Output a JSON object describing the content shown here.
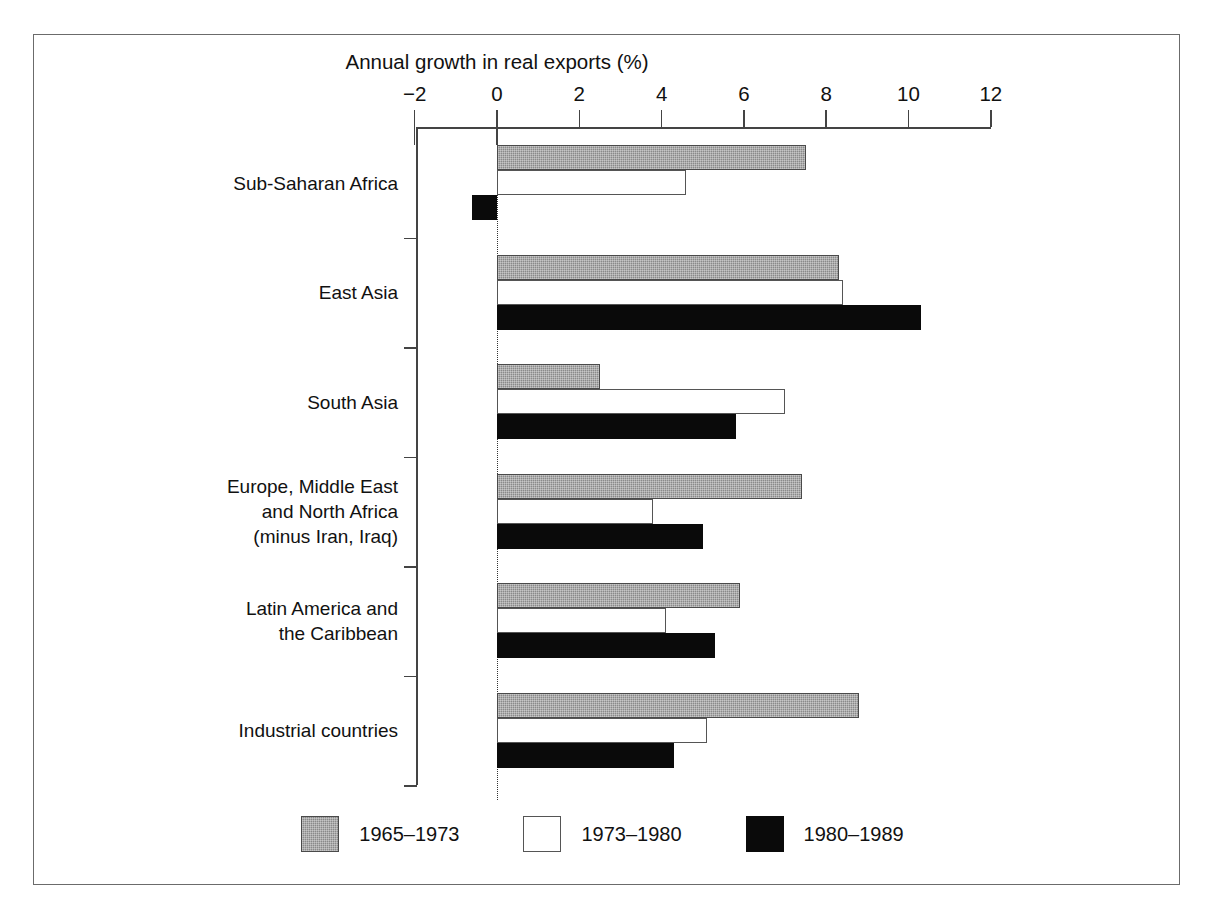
{
  "chart_data": {
    "type": "bar",
    "orientation": "horizontal",
    "title": "Annual growth in real exports (%)",
    "xlabel": "",
    "ylabel": "",
    "xlim": [
      -2,
      12
    ],
    "xticks": [
      -2,
      0,
      2,
      4,
      6,
      8,
      10,
      12
    ],
    "xtick_labels": [
      "−2",
      "0",
      "2",
      "4",
      "6",
      "8",
      "10",
      "12"
    ],
    "grid": false,
    "legend_position": "bottom",
    "zero_reference_line": true,
    "categories": [
      "Sub-Saharan Africa",
      "East Asia",
      "South Asia",
      "Europe, Middle East\nand North Africa\n(minus Iran, Iraq)",
      "Latin America and\nthe Caribbean",
      "Industrial countries"
    ],
    "series": [
      {
        "name": "1965–1973",
        "color": "#8a8a8a",
        "values": [
          7.5,
          8.3,
          2.5,
          7.4,
          5.9,
          8.8
        ]
      },
      {
        "name": "1973–1980",
        "color": "#ffffff",
        "values": [
          4.6,
          8.4,
          7.0,
          3.8,
          4.1,
          5.1
        ]
      },
      {
        "name": "1980–1989",
        "color": "#0a0a0a",
        "values": [
          -0.6,
          10.3,
          5.8,
          5.0,
          5.3,
          4.3
        ]
      }
    ]
  },
  "legend": {
    "items": [
      {
        "label": "1965–1973",
        "swatch": "gray"
      },
      {
        "label": "1973–1980",
        "swatch": "white"
      },
      {
        "label": "1980–1989",
        "swatch": "black"
      }
    ]
  },
  "caption_fragment": ""
}
